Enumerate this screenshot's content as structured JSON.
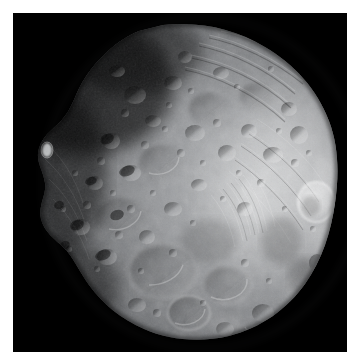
{
  "image": {
    "subject": "Phobos",
    "subject_type": "moon",
    "capture_style": "grayscale spacecraft photograph",
    "frame": {
      "width": 354,
      "height": 361,
      "matte_color": "#ffffff",
      "matte_thickness_px": 13,
      "plate_color": "#000000",
      "plate_left": 13,
      "plate_top": 13,
      "plate_width": 334,
      "plate_height": 339
    },
    "illumination": {
      "sun_direction": "from lower-right / right",
      "terminator_location": "upper-left limb",
      "brightest_region": "right limb and right-of-center plateau",
      "darkest_region": "upper-left shadowed terrain"
    },
    "palette": {
      "space_black": "#000000",
      "shadow_gray": "#17181a",
      "dark_regolith": "#3b3d40",
      "mid_regolith": "#6e7073",
      "light_regolith": "#97999c",
      "highlight_gray": "#c6c8ca",
      "specular_white": "#e4e6e7"
    },
    "body_outline": {
      "description": "irregular, roughly ovoid silhouette offset right-of-center",
      "bounds": {
        "left": 27,
        "top": 12,
        "right": 325,
        "bottom": 325
      }
    },
    "features": [
      {
        "name": "bright-rim-crater-right-limb",
        "cx": 303,
        "cy": 189,
        "r": 17,
        "brightness": "specular"
      },
      {
        "name": "bright-small-crater-left-terminator",
        "cx": 34,
        "cy": 137,
        "r": 5,
        "brightness": "specular"
      },
      {
        "name": "grooved-terrain-upper-right",
        "cx": 250,
        "cy": 70,
        "description": "parallel linear grooves / striations"
      },
      {
        "name": "grooved-terrain-right-flank",
        "cx": 265,
        "cy": 165,
        "description": "fine parallel lineations fanning down-right"
      },
      {
        "name": "large-degraded-crater-lower-center",
        "cx": 150,
        "cy": 258,
        "r": 33
      },
      {
        "name": "rimmed-crater-bottom-center",
        "cx": 175,
        "cy": 300,
        "r": 20
      },
      {
        "name": "crater-cluster-upper-center",
        "cx": 150,
        "cy": 95,
        "description": "dense field of small superposed craters"
      },
      {
        "name": "shadowed-crater-field-left",
        "cx": 60,
        "cy": 190,
        "description": "low-sun craters with long shadows"
      }
    ]
  }
}
